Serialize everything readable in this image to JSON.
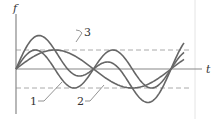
{
  "diagram": {
    "type": "wave-superposition",
    "axes": {
      "y_label": "f",
      "x_label": "t"
    },
    "curves": [
      {
        "id": "1",
        "label": "1",
        "description": "sine wave, frequency 2w, amplitude A",
        "color": "#6b6b6b"
      },
      {
        "id": "2",
        "label": "2",
        "description": "sine wave, frequency w, amplitude A",
        "color": "#6b6b6b"
      },
      {
        "id": "3",
        "label": "3",
        "description": "superposition of waves 1 and 2",
        "color": "#6b6b6b"
      }
    ],
    "reference_lines": [
      {
        "name": "upper-amplitude",
        "style": "dashed",
        "level": "+A"
      },
      {
        "name": "lower-amplitude",
        "style": "dashed",
        "level": "-A"
      }
    ],
    "colors": {
      "axis": "#888888",
      "curve": "#666666",
      "dashed": "#aaaaaa",
      "border": "#e0e0e0",
      "text": "#333333"
    }
  }
}
